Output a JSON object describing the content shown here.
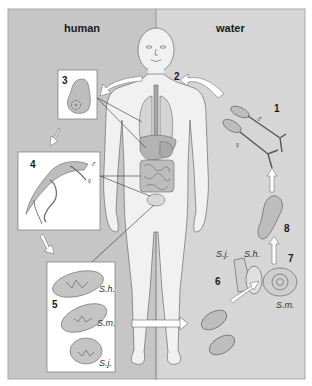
{
  "figure": {
    "sides": {
      "left_label": "human",
      "right_label": "water"
    },
    "stages": {
      "s1": "1",
      "s2": "2",
      "s3": "3",
      "s4": "4",
      "s5": "5",
      "s6": "6",
      "s7": "7",
      "s8": "8"
    },
    "symbols": {
      "male": "♂",
      "female": "♀"
    },
    "species": {
      "sh": "S.h.",
      "sm": "S.m.",
      "sj": "S.j."
    },
    "colors": {
      "left_bg": "#c6c6c6",
      "right_bg": "#d6d6d6",
      "body_fill": "#f1f1f1",
      "organ_fill": "#b9b9b9",
      "box_bg": "#ffffff",
      "arrow_fill": "#ffffff",
      "line": "#555555"
    }
  }
}
